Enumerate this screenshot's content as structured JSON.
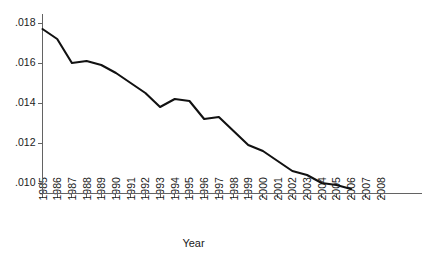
{
  "chart_data": {
    "type": "line",
    "title": "",
    "subtitle": "",
    "xlabel": "Year",
    "ylabel": "",
    "grid": false,
    "legend": "none",
    "line_color": "#111111",
    "axis_color": "#636363",
    "x": [
      1985,
      1986,
      1987,
      1988,
      1989,
      1990,
      1991,
      1992,
      1993,
      1994,
      1995,
      1996,
      1997,
      1998,
      1999,
      2000,
      2001,
      2002,
      2003,
      2004,
      2005,
      2006
    ],
    "values": [
      0.0177,
      0.0172,
      0.016,
      0.0161,
      0.0159,
      0.0155,
      0.015,
      0.0145,
      0.0138,
      0.0142,
      0.0141,
      0.0132,
      0.0133,
      0.0126,
      0.0119,
      0.0116,
      0.0111,
      0.0106,
      0.0104,
      0.01,
      0.0099,
      0.0097
    ],
    "series": [
      {
        "name": "rate",
        "values": [
          0.0177,
          0.0172,
          0.016,
          0.0161,
          0.0159,
          0.0155,
          0.015,
          0.0145,
          0.0138,
          0.0142,
          0.0141,
          0.0132,
          0.0133,
          0.0126,
          0.0119,
          0.0116,
          0.0111,
          0.0106,
          0.0104,
          0.01,
          0.0099,
          0.0097
        ]
      }
    ],
    "xlim": [
      1985,
      2008
    ],
    "ylim": [
      0.0094,
      0.01835
    ],
    "y_ticks": [
      0.018,
      0.016,
      0.014,
      0.012,
      0.01
    ],
    "y_tick_labels": [
      ".018",
      ".016",
      ".014",
      ".012",
      ".010"
    ],
    "x_ticks": [
      1985,
      1986,
      1987,
      1988,
      1989,
      1990,
      1991,
      1992,
      1993,
      1994,
      1995,
      1996,
      1997,
      1998,
      1999,
      2000,
      2001,
      2002,
      2003,
      2004,
      2005,
      2006,
      2007,
      2008
    ],
    "x_tick_labels": [
      "1985",
      "1986",
      "1987",
      "1988",
      "1989",
      "1990",
      "1991",
      "1992",
      "1993",
      "1994",
      "1995",
      "1996",
      "1997",
      "1998",
      "1999",
      "2000",
      "2001",
      "2002",
      "2003",
      "2004",
      "2005",
      "2006",
      "2007",
      "2008"
    ]
  }
}
